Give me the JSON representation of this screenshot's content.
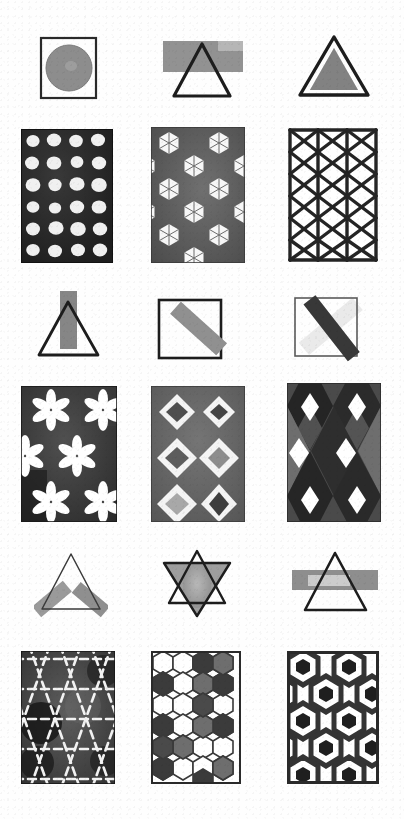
{
  "plate": {
    "title": "Hand-painted geometric figures plate",
    "background_color": "#fefefe",
    "width": 404,
    "height": 819,
    "grid": {
      "columns": 3,
      "rows": 6
    },
    "ink_color": "#1d1d1d",
    "media_note": "grayscale ink and wash"
  },
  "palette": {
    "ink": "#1d1d1d",
    "near_black": "#2a2a2a",
    "dark_gray": "#4a4a4a",
    "mid_gray": "#6f6f6f",
    "light_gray": "#9b9b9b",
    "pale_gray": "#c2c2c2",
    "wash_gray": "#8d8d8d",
    "paper": "#fefefe"
  },
  "figures": [
    {
      "id": "r1c1",
      "row": 1,
      "column": 1,
      "name": "square-with-filled-circle",
      "kind": "shape-composition",
      "shapes": [
        "square-outline",
        "filled-circle"
      ],
      "fill": "#8d8d8d",
      "stroke": "#2a2a2a",
      "x": 40,
      "y": 37,
      "width": 58,
      "height": 63
    },
    {
      "id": "r1c2",
      "row": 1,
      "column": 2,
      "name": "triangle-over-horizontal-band",
      "kind": "shape-composition",
      "shapes": [
        "gray-rectangle-band",
        "triangle-outline"
      ],
      "fill": "#8e8e8e",
      "stroke": "#1d1d1d",
      "x": 160,
      "y": 40,
      "width": 92,
      "height": 60
    },
    {
      "id": "r1c3",
      "row": 1,
      "column": 3,
      "name": "filled-triangle-with-outline",
      "kind": "shape-composition",
      "shapes": [
        "triangle-outline",
        "filled-triangle"
      ],
      "fill": "#7d7d7d",
      "stroke": "#1d1d1d",
      "x": 296,
      "y": 35,
      "width": 74,
      "height": 66
    },
    {
      "id": "r2c1",
      "row": 2,
      "column": 1,
      "name": "circle-dot-lattice-tile",
      "kind": "pattern-tile",
      "motif": "white circles on dark ground",
      "grid": {
        "columns": 4,
        "rows": 6
      },
      "background": "#2e2e2e",
      "motif_color": "#ffffff",
      "x": 22,
      "y": 130,
      "width": 90,
      "height": 132
    },
    {
      "id": "r2c2",
      "row": 2,
      "column": 2,
      "name": "spoked-hexagon-tile",
      "kind": "pattern-tile",
      "motif": "white hexagons with radial spokes, offset rows",
      "grid": {
        "columns": 2,
        "rows": 6
      },
      "background": "#5c5c5c",
      "motif_color": "#f7f7f7",
      "x": 152,
      "y": 128,
      "width": 92,
      "height": 134
    },
    {
      "id": "r2c3",
      "row": 2,
      "column": 3,
      "name": "triangular-lattice-tile",
      "kind": "pattern-tile",
      "motif": "thick dark triangular lattice on white",
      "grid": {
        "columns": 4,
        "rows": 6
      },
      "background": "#ffffff",
      "motif_color": "#242424",
      "x": 288,
      "y": 128,
      "width": 90,
      "height": 134
    },
    {
      "id": "r3c1",
      "row": 3,
      "column": 1,
      "name": "triangle-with-vertical-band",
      "kind": "shape-composition",
      "shapes": [
        "vertical-gray-band",
        "triangle-outline"
      ],
      "fill": "#8b8b8b",
      "stroke": "#1d1d1d",
      "x": 34,
      "y": 290,
      "width": 72,
      "height": 72
    },
    {
      "id": "r3c2",
      "row": 3,
      "column": 2,
      "name": "square-with-diagonal-band",
      "kind": "shape-composition",
      "shapes": [
        "square-outline",
        "diagonal-gray-band"
      ],
      "fill": "#8b8b8b",
      "stroke": "#1d1d1d",
      "x": 157,
      "y": 295,
      "width": 72,
      "height": 66
    },
    {
      "id": "r3c3",
      "row": 3,
      "column": 3,
      "name": "square-with-dark-diagonal-band",
      "kind": "shape-composition",
      "shapes": [
        "square-outline",
        "dark-diagonal-band"
      ],
      "fill": "#3f3f3f",
      "stroke": "#4a4a4a",
      "x": 292,
      "y": 292,
      "width": 72,
      "height": 68
    },
    {
      "id": "r4c1",
      "row": 4,
      "column": 1,
      "name": "six-petal-flower-tile",
      "kind": "pattern-tile",
      "motif": "white six-petal rosettes on dark ground",
      "grid": {
        "columns": 2,
        "rows": 3
      },
      "background": "#3c3c3c",
      "motif_color": "#ffffff",
      "x": 22,
      "y": 387,
      "width": 94,
      "height": 134
    },
    {
      "id": "r4c2",
      "row": 4,
      "column": 2,
      "name": "diamond-ring-tile",
      "kind": "pattern-tile",
      "motif": "white diamond outlines with shaded cores",
      "grid": {
        "columns": 2,
        "rows": 3
      },
      "background": "#666666",
      "motif_color": "#f4f4f4",
      "x": 152,
      "y": 387,
      "width": 92,
      "height": 134
    },
    {
      "id": "r4c3",
      "row": 4,
      "column": 3,
      "name": "argyle-diamond-tile",
      "kind": "pattern-tile",
      "motif": "tonal argyle diamonds with white accents",
      "grid": {
        "columns": 2,
        "rows": 3
      },
      "background": "#3a3a3a",
      "motif_color": "#ffffff",
      "x": 288,
      "y": 384,
      "width": 92,
      "height": 137
    },
    {
      "id": "r5c1",
      "row": 5,
      "column": 1,
      "name": "triangle-with-two-tilted-bands",
      "kind": "shape-composition",
      "shapes": [
        "thin-triangle-outline",
        "left-tilted-band",
        "right-tilted-band"
      ],
      "fill": "#9a9a9a",
      "stroke": "#3a3a3a",
      "x": 36,
      "y": 549,
      "width": 68,
      "height": 68
    },
    {
      "id": "r5c2",
      "row": 5,
      "column": 2,
      "name": "hexagram-with-wash",
      "kind": "shape-composition",
      "shapes": [
        "up-triangle-outline",
        "down-triangle-filled",
        "gray-wash"
      ],
      "fill": "#9a9a9a",
      "stroke": "#1d1d1d",
      "x": 158,
      "y": 548,
      "width": 76,
      "height": 72
    },
    {
      "id": "r5c3",
      "row": 5,
      "column": 3,
      "name": "triangle-crossed-by-band",
      "kind": "shape-composition",
      "shapes": [
        "triangle-outline",
        "horizontal-gray-band"
      ],
      "fill": "#8e8e8e",
      "stroke": "#1d1d1d",
      "x": 292,
      "y": 550,
      "width": 86,
      "height": 68
    },
    {
      "id": "r6c1",
      "row": 6,
      "column": 1,
      "name": "star-triangle-lattice-tile",
      "kind": "pattern-tile",
      "motif": "white star-and-triangle lattice on mottled dark ground",
      "grid": {
        "columns": 3,
        "rows": 5
      },
      "background": "#3a3a3a",
      "motif_color": "#f2f2f2",
      "x": 22,
      "y": 652,
      "width": 92,
      "height": 131
    },
    {
      "id": "r6c2",
      "row": 6,
      "column": 2,
      "name": "honeycomb-tile",
      "kind": "pattern-tile",
      "motif": "hexagon honeycomb with scattered dark cells",
      "grid": {
        "columns": 4,
        "rows": 6
      },
      "background": "#ffffff",
      "motif_color": "#4a4a4a",
      "x": 152,
      "y": 652,
      "width": 88,
      "height": 131
    },
    {
      "id": "r6c3",
      "row": 6,
      "column": 3,
      "name": "hexagon-web-tile",
      "kind": "pattern-tile",
      "motif": "thick hexagonal web with dark hexagon centres",
      "grid": {
        "columns": 3,
        "rows": 5
      },
      "background": "#ffffff",
      "motif_color": "#343434",
      "x": 288,
      "y": 652,
      "width": 90,
      "height": 131
    }
  ]
}
